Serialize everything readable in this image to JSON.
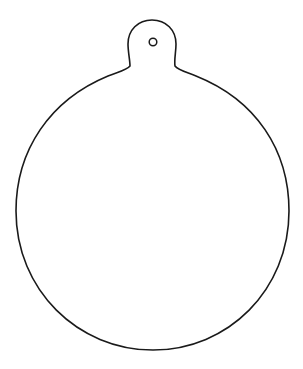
{
  "image": {
    "subject": "Christmas ornament outline (coloring page template)",
    "line_color": "#1a1a1a",
    "background_color": "#ffffff",
    "parts": [
      "ornament-body",
      "hanging-tab",
      "hanging-hole"
    ]
  }
}
